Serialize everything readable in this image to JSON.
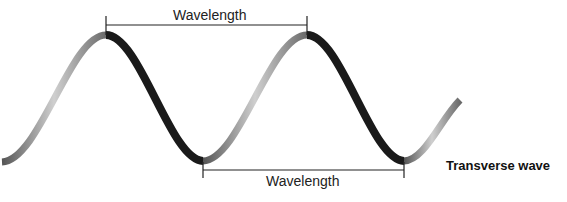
{
  "diagram": {
    "title": "Transverse wave",
    "top_measure": {
      "label": "Wavelength",
      "from": "crest",
      "to": "crest"
    },
    "bottom_measure": {
      "label": "Wavelength",
      "from": "trough",
      "to": "trough"
    }
  }
}
